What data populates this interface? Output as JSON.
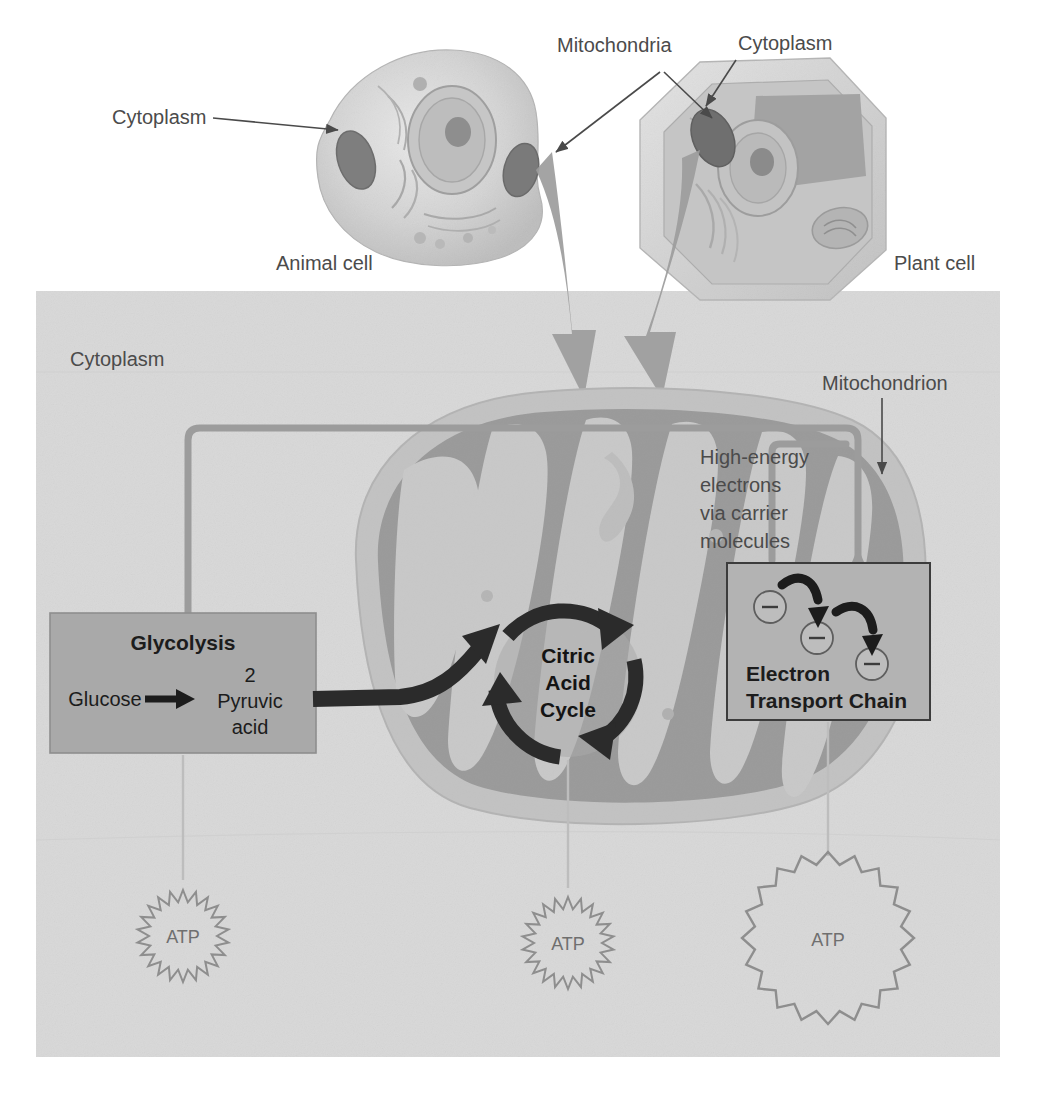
{
  "figure": {
    "background_color": "#ffffff",
    "panel_color": "#d8d8d8",
    "process_box_color": "#a9a9a9",
    "mitochondrion_outer_color": "#c2c2c2",
    "mitochondrion_matrix_color": "#9a9a9a",
    "arrow_color": "#9c9c9c",
    "dark_arrow_color": "#2b2b2b",
    "label_color": "#4b4b4b"
  },
  "top_labels": {
    "cytoplasm_left": "Cytoplasm",
    "mitochondria": "Mitochondria",
    "cytoplasm_right": "Cytoplasm",
    "animal_cell": "Animal cell",
    "plant_cell": "Plant cell"
  },
  "panel_labels": {
    "cytoplasm": "Cytoplasm",
    "mitochondrion": "Mitochondrion",
    "carrier_line1": "High-energy",
    "carrier_line2": "electrons",
    "carrier_line3": "via carrier",
    "carrier_line4": "molecules"
  },
  "glycolysis": {
    "title": "Glycolysis",
    "reactant": "Glucose",
    "count": "2",
    "product_line1": "Pyruvic",
    "product_line2": "acid"
  },
  "citric_acid_cycle": {
    "line1": "Citric",
    "line2": "Acid",
    "line3": "Cycle"
  },
  "electron_transport_chain": {
    "line1": "Electron",
    "line2": "Transport Chain",
    "electron_symbol": "−",
    "electron_count": 3
  },
  "atp_outputs": [
    {
      "label": "ATP",
      "source": "glycolysis",
      "size": "small"
    },
    {
      "label": "ATP",
      "source": "citric-acid-cycle",
      "size": "small"
    },
    {
      "label": "ATP",
      "source": "electron-transport-chain",
      "size": "large"
    }
  ],
  "chart_data": {
    "type": "diagram",
    "stages": [
      {
        "name": "Glycolysis",
        "location": "Cytoplasm",
        "input": "Glucose",
        "output": "2 Pyruvic acid",
        "atp_yield": "small"
      },
      {
        "name": "Citric Acid Cycle",
        "location": "Mitochondrion",
        "input": "2 Pyruvic acid",
        "output": "High-energy electrons via carrier molecules",
        "atp_yield": "small"
      },
      {
        "name": "Electron Transport Chain",
        "location": "Mitochondrion",
        "input": "High-energy electrons via carrier molecules",
        "output": "ATP",
        "atp_yield": "large"
      }
    ],
    "cell_types": [
      "Animal cell",
      "Plant cell"
    ],
    "organelles": [
      "Cytoplasm",
      "Mitochondria",
      "Mitochondrion"
    ]
  }
}
